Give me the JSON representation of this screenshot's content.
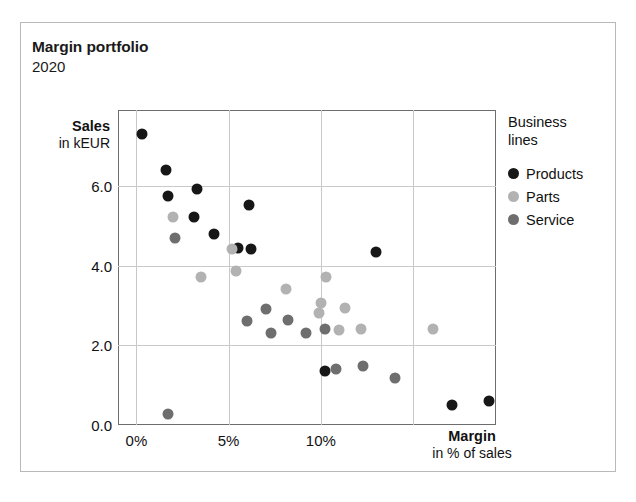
{
  "header": {
    "title": "Margin portfolio",
    "subtitle": "2020"
  },
  "legend": {
    "title_line1": "Business",
    "title_line2": "lines",
    "entries": [
      {
        "label": "Products",
        "color": "#171717"
      },
      {
        "label": "Parts",
        "color": "#b2b2b2"
      },
      {
        "label": "Service",
        "color": "#6e6e6e"
      }
    ]
  },
  "chart_data": {
    "type": "scatter",
    "title": "Margin portfolio",
    "subtitle": "2020",
    "xlabel": "Margin",
    "xlabel_sub": "in % of sales",
    "ylabel": "Sales",
    "ylabel_sub": "in kEUR",
    "xlim": [
      -1.0,
      19.5
    ],
    "ylim": [
      0.0,
      7.9
    ],
    "xticks": [
      0,
      5,
      10
    ],
    "xticklabels": [
      "0%",
      "5%",
      "10%"
    ],
    "yticks": [
      0.0,
      2.0,
      4.0,
      6.0
    ],
    "yticklabels": [
      "0.0",
      "2.0",
      "4.0",
      "6.0"
    ],
    "grid": true,
    "gridlines_x": [
      0,
      5,
      10,
      15
    ],
    "gridlines_y": [
      2.0,
      4.0,
      6.0
    ],
    "legend_position": "right",
    "series": [
      {
        "name": "Products",
        "color": "#171717",
        "points": [
          {
            "x": 0.3,
            "y": 7.3
          },
          {
            "x": 1.6,
            "y": 6.4
          },
          {
            "x": 1.7,
            "y": 5.75
          },
          {
            "x": 3.3,
            "y": 5.92
          },
          {
            "x": 3.1,
            "y": 5.22
          },
          {
            "x": 4.2,
            "y": 4.78
          },
          {
            "x": 6.1,
            "y": 5.52
          },
          {
            "x": 5.5,
            "y": 4.43
          },
          {
            "x": 6.2,
            "y": 4.42
          },
          {
            "x": 13.0,
            "y": 4.33
          },
          {
            "x": 10.2,
            "y": 1.35
          },
          {
            "x": 17.1,
            "y": 0.5
          },
          {
            "x": 19.1,
            "y": 0.6
          }
        ]
      },
      {
        "name": "Parts",
        "color": "#b2b2b2",
        "points": [
          {
            "x": 2.0,
            "y": 5.22
          },
          {
            "x": 3.5,
            "y": 3.7
          },
          {
            "x": 5.2,
            "y": 4.42
          },
          {
            "x": 5.4,
            "y": 3.87
          },
          {
            "x": 8.1,
            "y": 3.42
          },
          {
            "x": 10.3,
            "y": 3.72
          },
          {
            "x": 10.0,
            "y": 3.05
          },
          {
            "x": 9.9,
            "y": 2.82
          },
          {
            "x": 11.3,
            "y": 2.93
          },
          {
            "x": 11.0,
            "y": 2.38
          },
          {
            "x": 12.2,
            "y": 2.42
          },
          {
            "x": 16.1,
            "y": 2.4
          }
        ]
      },
      {
        "name": "Service",
        "color": "#6e6e6e",
        "points": [
          {
            "x": 2.1,
            "y": 4.7
          },
          {
            "x": 1.7,
            "y": 0.28
          },
          {
            "x": 6.0,
            "y": 2.62
          },
          {
            "x": 7.0,
            "y": 2.92
          },
          {
            "x": 7.3,
            "y": 2.3
          },
          {
            "x": 8.2,
            "y": 2.63
          },
          {
            "x": 9.2,
            "y": 2.3
          },
          {
            "x": 10.2,
            "y": 2.42
          },
          {
            "x": 10.8,
            "y": 1.4
          },
          {
            "x": 12.3,
            "y": 1.48
          },
          {
            "x": 14.0,
            "y": 1.18
          }
        ]
      }
    ]
  }
}
